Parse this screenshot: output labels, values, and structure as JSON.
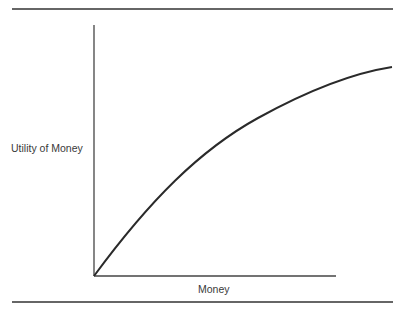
{
  "figure": {
    "y_axis_label": "Utility of Money",
    "x_axis_label": "Money",
    "curve_description": "Concave increasing curve showing diminishing marginal utility of money",
    "colors": {
      "line": "#2a2a2a",
      "rule": "#333333"
    }
  }
}
